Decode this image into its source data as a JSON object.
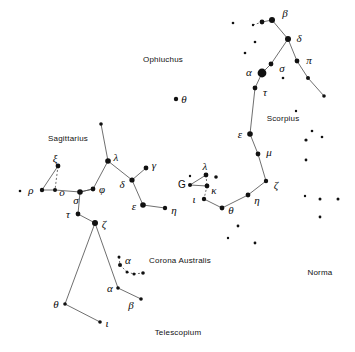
{
  "figure": {
    "kind": "star-chart",
    "width": 355,
    "height": 352,
    "background_color": "#ffffff",
    "star_color": "#111111",
    "line_color": "#4a4a4a",
    "label_color": "#0b0b0b"
  },
  "constellation_names": [
    {
      "text": "Ophiuchus",
      "x": 163,
      "y": 59
    },
    {
      "text": "Sagittarius",
      "x": 68,
      "y": 138
    },
    {
      "text": "Scorpius",
      "x": 283,
      "y": 118
    },
    {
      "text": "Corona Australis",
      "x": 180,
      "y": 260
    },
    {
      "text": "Norma",
      "x": 320,
      "y": 272
    },
    {
      "text": "Telescopium",
      "x": 178,
      "y": 332
    }
  ],
  "star_labels": [
    {
      "text": "β",
      "x": 285,
      "y": 13,
      "style": "greek"
    },
    {
      "text": "δ",
      "x": 299,
      "y": 38,
      "style": "greek"
    },
    {
      "text": "π",
      "x": 309,
      "y": 60,
      "style": "greek"
    },
    {
      "text": "σ",
      "x": 282,
      "y": 68,
      "style": "greek"
    },
    {
      "text": "α",
      "x": 249,
      "y": 72,
      "style": "greek"
    },
    {
      "text": "τ",
      "x": 265,
      "y": 92,
      "style": "greek"
    },
    {
      "text": "ε",
      "x": 240,
      "y": 134,
      "style": "greek"
    },
    {
      "text": "μ",
      "x": 269,
      "y": 152,
      "style": "greek"
    },
    {
      "text": "ζ",
      "x": 276,
      "y": 185,
      "style": "greek"
    },
    {
      "text": "η",
      "x": 257,
      "y": 200,
      "style": "greek"
    },
    {
      "text": "θ",
      "x": 184,
      "y": 99,
      "style": "greek"
    },
    {
      "text": "λ",
      "x": 205,
      "y": 166,
      "style": "greek"
    },
    {
      "text": "G",
      "x": 182,
      "y": 185,
      "style": "roman"
    },
    {
      "text": "κ",
      "x": 214,
      "y": 190,
      "style": "greek"
    },
    {
      "text": "ι",
      "x": 194,
      "y": 199,
      "style": "greek"
    },
    {
      "text": "θ",
      "x": 231,
      "y": 210,
      "style": "greek"
    },
    {
      "text": "ξ",
      "x": 55,
      "y": 158,
      "style": "greek"
    },
    {
      "text": "ρ",
      "x": 31,
      "y": 190,
      "style": "greek"
    },
    {
      "text": "o",
      "x": 62,
      "y": 192,
      "style": "greek"
    },
    {
      "text": "σ",
      "x": 76,
      "y": 200,
      "style": "greek"
    },
    {
      "text": "φ",
      "x": 102,
      "y": 189,
      "style": "greek"
    },
    {
      "text": "λ",
      "x": 116,
      "y": 157,
      "style": "greek"
    },
    {
      "text": "τ",
      "x": 68,
      "y": 214,
      "style": "greek"
    },
    {
      "text": "ζ",
      "x": 104,
      "y": 224,
      "style": "greek"
    },
    {
      "text": "γ",
      "x": 154,
      "y": 165,
      "style": "greek"
    },
    {
      "text": "δ",
      "x": 122,
      "y": 184,
      "style": "greek"
    },
    {
      "text": "ε",
      "x": 134,
      "y": 206,
      "style": "greek"
    },
    {
      "text": "η",
      "x": 174,
      "y": 210,
      "style": "greek"
    },
    {
      "text": "α",
      "x": 128,
      "y": 260,
      "style": "greek"
    },
    {
      "text": "α",
      "x": 110,
      "y": 288,
      "style": "greek"
    },
    {
      "text": "β",
      "x": 131,
      "y": 305,
      "style": "greek"
    },
    {
      "text": "θ",
      "x": 56,
      "y": 304,
      "style": "greek"
    },
    {
      "text": "ι",
      "x": 107,
      "y": 323,
      "style": "greek"
    }
  ],
  "stars": [
    {
      "name": "scorpius-beta",
      "x": 272,
      "y": 20,
      "r": 3.0
    },
    {
      "name": "scorpius-beta-companion",
      "x": 262,
      "y": 22,
      "r": 2.4
    },
    {
      "name": "scorpius-beta-faint",
      "x": 253,
      "y": 25,
      "r": 1.2
    },
    {
      "name": "scorpius-delta",
      "x": 288,
      "y": 39,
      "r": 3.0
    },
    {
      "name": "scorpius-pi",
      "x": 297,
      "y": 61,
      "r": 2.4
    },
    {
      "name": "scorpius-pi-down1",
      "x": 308,
      "y": 78,
      "r": 2.0
    },
    {
      "name": "scorpius-pi-down2",
      "x": 324,
      "y": 96,
      "r": 1.8
    },
    {
      "name": "scorpius-sigma",
      "x": 271,
      "y": 64,
      "r": 2.4
    },
    {
      "name": "scorpius-alpha-antares",
      "x": 262,
      "y": 73,
      "r": 4.4
    },
    {
      "name": "scorpius-tau",
      "x": 255,
      "y": 88,
      "r": 2.4
    },
    {
      "name": "scorpius-epsilon",
      "x": 250,
      "y": 134,
      "r": 2.8
    },
    {
      "name": "scorpius-mu",
      "x": 258,
      "y": 154,
      "r": 2.4
    },
    {
      "name": "scorpius-zeta",
      "x": 266,
      "y": 181,
      "r": 2.2
    },
    {
      "name": "scorpius-eta",
      "x": 248,
      "y": 195,
      "r": 2.4
    },
    {
      "name": "ophiuchus-theta",
      "x": 176,
      "y": 99,
      "r": 2.2
    },
    {
      "name": "cra-lambda",
      "x": 206,
      "y": 175,
      "r": 2.4
    },
    {
      "name": "cra-lambda-companion",
      "x": 216,
      "y": 177,
      "r": 1.8
    },
    {
      "name": "cra-kappa",
      "x": 207,
      "y": 186,
      "r": 2.4
    },
    {
      "name": "cra-g",
      "x": 190,
      "y": 185,
      "r": 2.0
    },
    {
      "name": "cra-iota",
      "x": 204,
      "y": 199,
      "r": 2.2
    },
    {
      "name": "cra-theta",
      "x": 222,
      "y": 208,
      "r": 2.4
    },
    {
      "name": "sgr-xi",
      "x": 58,
      "y": 166,
      "r": 2.4
    },
    {
      "name": "sgr-rho",
      "x": 42,
      "y": 190,
      "r": 2.2
    },
    {
      "name": "sgr-rho-faint",
      "x": 20,
      "y": 191,
      "r": 1.3
    },
    {
      "name": "sgr-omicron",
      "x": 55,
      "y": 190,
      "r": 2.0
    },
    {
      "name": "sgr-sigma",
      "x": 80,
      "y": 192,
      "r": 2.8
    },
    {
      "name": "sgr-phi",
      "x": 93,
      "y": 189,
      "r": 2.4
    },
    {
      "name": "sgr-lambda",
      "x": 108,
      "y": 161,
      "r": 2.8
    },
    {
      "name": "sgr-lambda-up",
      "x": 101,
      "y": 124,
      "r": 1.8
    },
    {
      "name": "sgr-tau",
      "x": 78,
      "y": 214,
      "r": 2.4
    },
    {
      "name": "sgr-zeta",
      "x": 95,
      "y": 223,
      "r": 3.0
    },
    {
      "name": "sgr-gamma",
      "x": 146,
      "y": 168,
      "r": 2.4
    },
    {
      "name": "sgr-delta",
      "x": 132,
      "y": 180,
      "r": 2.6
    },
    {
      "name": "sgr-epsilon",
      "x": 143,
      "y": 205,
      "r": 2.8
    },
    {
      "name": "sgr-eta",
      "x": 165,
      "y": 208,
      "r": 2.2
    },
    {
      "name": "cra-arc-1",
      "x": 119,
      "y": 257,
      "r": 1.5
    },
    {
      "name": "cra-arc-2",
      "x": 120,
      "y": 265,
      "r": 2.0
    },
    {
      "name": "cra-arc-3",
      "x": 127,
      "y": 272,
      "r": 1.5
    },
    {
      "name": "cra-arc-4",
      "x": 134,
      "y": 274,
      "r": 1.5
    },
    {
      "name": "cra-arc-5",
      "x": 143,
      "y": 273,
      "r": 1.8
    },
    {
      "name": "tel-alpha",
      "x": 118,
      "y": 288,
      "r": 1.8
    },
    {
      "name": "tel-beta",
      "x": 141,
      "y": 299,
      "r": 1.8
    },
    {
      "name": "tel-theta",
      "x": 65,
      "y": 304,
      "r": 1.8
    },
    {
      "name": "tel-iota",
      "x": 100,
      "y": 322,
      "r": 1.8
    },
    {
      "name": "field-1",
      "x": 233,
      "y": 23,
      "r": 1.3
    },
    {
      "name": "field-2",
      "x": 255,
      "y": 42,
      "r": 1.3
    },
    {
      "name": "field-3",
      "x": 245,
      "y": 53,
      "r": 1.3
    },
    {
      "name": "field-4",
      "x": 283,
      "y": 78,
      "r": 1.3
    },
    {
      "name": "field-5",
      "x": 296,
      "y": 111,
      "r": 1.2
    },
    {
      "name": "field-6",
      "x": 312,
      "y": 131,
      "r": 1.3
    },
    {
      "name": "field-7",
      "x": 322,
      "y": 137,
      "r": 1.3
    },
    {
      "name": "field-8",
      "x": 306,
      "y": 140,
      "r": 1.6
    },
    {
      "name": "field-9",
      "x": 306,
      "y": 160,
      "r": 1.4
    },
    {
      "name": "field-10",
      "x": 305,
      "y": 196,
      "r": 1.2
    },
    {
      "name": "field-11",
      "x": 320,
      "y": 199,
      "r": 1.5
    },
    {
      "name": "field-12",
      "x": 338,
      "y": 199,
      "r": 1.5
    },
    {
      "name": "field-13",
      "x": 320,
      "y": 217,
      "r": 1.4
    },
    {
      "name": "field-14",
      "x": 238,
      "y": 226,
      "r": 1.4
    },
    {
      "name": "field-15",
      "x": 255,
      "y": 243,
      "r": 1.4
    },
    {
      "name": "field-16",
      "x": 228,
      "y": 238,
      "r": 1.2
    },
    {
      "name": "field-17",
      "x": 190,
      "y": 176,
      "r": 1.2
    }
  ],
  "lines": [
    {
      "name": "scorpius-head-beta-companion",
      "x1": 253,
      "y1": 25,
      "x2": 262,
      "y2": 22,
      "dashed": true
    },
    {
      "name": "scorpius-beta-pair",
      "x1": 262,
      "y1": 22,
      "x2": 272,
      "y2": 20
    },
    {
      "name": "scorpius-beta-delta",
      "x1": 272,
      "y1": 20,
      "x2": 288,
      "y2": 39
    },
    {
      "name": "scorpius-delta-pi",
      "x1": 288,
      "y1": 39,
      "x2": 297,
      "y2": 61
    },
    {
      "name": "scorpius-pi-down1",
      "x1": 297,
      "y1": 61,
      "x2": 308,
      "y2": 78
    },
    {
      "name": "scorpius-pi-down2",
      "x1": 308,
      "y1": 78,
      "x2": 324,
      "y2": 96
    },
    {
      "name": "scorpius-delta-sigma",
      "x1": 288,
      "y1": 39,
      "x2": 271,
      "y2": 64
    },
    {
      "name": "scorpius-sigma-alpha",
      "x1": 271,
      "y1": 64,
      "x2": 262,
      "y2": 73
    },
    {
      "name": "scorpius-alpha-tau",
      "x1": 262,
      "y1": 73,
      "x2": 255,
      "y2": 88
    },
    {
      "name": "scorpius-tau-epsilon",
      "x1": 255,
      "y1": 88,
      "x2": 250,
      "y2": 134
    },
    {
      "name": "scorpius-epsilon-mu",
      "x1": 250,
      "y1": 134,
      "x2": 258,
      "y2": 154
    },
    {
      "name": "scorpius-mu-zeta",
      "x1": 258,
      "y1": 154,
      "x2": 266,
      "y2": 181
    },
    {
      "name": "scorpius-zeta-eta",
      "x1": 266,
      "y1": 181,
      "x2": 248,
      "y2": 195
    },
    {
      "name": "scorpius-eta-theta",
      "x1": 248,
      "y1": 195,
      "x2": 222,
      "y2": 208
    },
    {
      "name": "cra-g-lambda",
      "x1": 190,
      "y1": 185,
      "x2": 206,
      "y2": 175
    },
    {
      "name": "cra-lambda-kappa",
      "x1": 206,
      "y1": 175,
      "x2": 207,
      "y2": 186,
      "dashed": true
    },
    {
      "name": "cra-kappa-g",
      "x1": 207,
      "y1": 186,
      "x2": 190,
      "y2": 185
    },
    {
      "name": "cra-kappa-iota",
      "x1": 207,
      "y1": 186,
      "x2": 204,
      "y2": 199,
      "dashed": true
    },
    {
      "name": "cra-iota-theta",
      "x1": 204,
      "y1": 199,
      "x2": 222,
      "y2": 208
    },
    {
      "name": "sgr-xi-rho",
      "x1": 58,
      "y1": 166,
      "x2": 42,
      "y2": 190
    },
    {
      "name": "sgr-xi-omicron",
      "x1": 58,
      "y1": 166,
      "x2": 55,
      "y2": 190,
      "dashed": true
    },
    {
      "name": "sgr-rho-omicron",
      "x1": 42,
      "y1": 190,
      "x2": 55,
      "y2": 190
    },
    {
      "name": "sgr-omicron-sigma",
      "x1": 55,
      "y1": 190,
      "x2": 80,
      "y2": 192
    },
    {
      "name": "sgr-sigma-phi",
      "x1": 80,
      "y1": 192,
      "x2": 93,
      "y2": 189
    },
    {
      "name": "sgr-phi-lambda",
      "x1": 93,
      "y1": 189,
      "x2": 108,
      "y2": 161
    },
    {
      "name": "sgr-lambda-up",
      "x1": 108,
      "y1": 161,
      "x2": 101,
      "y2": 124
    },
    {
      "name": "sgr-lambda-delta",
      "x1": 108,
      "y1": 161,
      "x2": 132,
      "y2": 180
    },
    {
      "name": "sgr-delta-gamma",
      "x1": 132,
      "y1": 180,
      "x2": 146,
      "y2": 168
    },
    {
      "name": "sgr-delta-epsilon",
      "x1": 132,
      "y1": 180,
      "x2": 143,
      "y2": 205
    },
    {
      "name": "sgr-epsilon-eta",
      "x1": 143,
      "y1": 205,
      "x2": 165,
      "y2": 208
    },
    {
      "name": "sgr-sigma-tau",
      "x1": 80,
      "y1": 192,
      "x2": 78,
      "y2": 214
    },
    {
      "name": "sgr-tau-zeta",
      "x1": 78,
      "y1": 214,
      "x2": 95,
      "y2": 223
    },
    {
      "name": "sgr-phi-sigma-diag",
      "x1": 93,
      "y1": 189,
      "x2": 80,
      "y2": 192
    },
    {
      "name": "tel-zeta-theta",
      "x1": 95,
      "y1": 223,
      "x2": 65,
      "y2": 304
    },
    {
      "name": "tel-zeta-alpha",
      "x1": 95,
      "y1": 223,
      "x2": 118,
      "y2": 288
    },
    {
      "name": "tel-theta-iota",
      "x1": 65,
      "y1": 304,
      "x2": 100,
      "y2": 322
    },
    {
      "name": "tel-alpha-beta",
      "x1": 118,
      "y1": 288,
      "x2": 141,
      "y2": 299
    },
    {
      "name": "cra-arc-1-2",
      "x1": 119,
      "y1": 257,
      "x2": 120,
      "y2": 265,
      "dashed": true
    },
    {
      "name": "cra-arc-2-3",
      "x1": 120,
      "y1": 265,
      "x2": 127,
      "y2": 272,
      "dashed": true
    },
    {
      "name": "cra-arc-3-4",
      "x1": 127,
      "y1": 272,
      "x2": 134,
      "y2": 274,
      "dashed": true
    },
    {
      "name": "cra-arc-4-5",
      "x1": 134,
      "y1": 274,
      "x2": 143,
      "y2": 273,
      "dashed": true
    }
  ]
}
